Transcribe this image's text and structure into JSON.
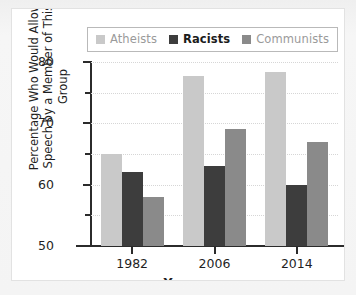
{
  "chart_data": {
    "type": "bar",
    "title": "",
    "xlabel": "Year",
    "ylabel": "Percentage Who Would Allow Speech by a Member of This Group",
    "ylabel_line1": "Percentage Who Would Allow",
    "ylabel_line2": "Speech by a Member of This Group",
    "categories": [
      "1982",
      "2006",
      "2014"
    ],
    "series": [
      {
        "name": "Atheists",
        "color": "#c9c9c9",
        "values": [
          65.0,
          77.8,
          78.4
        ]
      },
      {
        "name": "Racists",
        "color": "#3d3d3d",
        "values": [
          62.0,
          63.0,
          60.0
        ]
      },
      {
        "name": "Communists",
        "color": "#8a8a8a",
        "values": [
          58.0,
          69.0,
          67.0
        ]
      }
    ],
    "ylim": [
      50,
      80
    ],
    "ytick_major": [
      50,
      60,
      70,
      80
    ],
    "ytick_minor": [
      55,
      65,
      75
    ],
    "ytick_labels": [
      "50",
      "60",
      "70",
      "80"
    ],
    "grid": true,
    "grid_color": "#d6d6d6",
    "legend_position": "top",
    "axis_color": "#2b2b2b",
    "background": "#ffffff"
  },
  "legend": {
    "items": [
      {
        "label": "Atheists",
        "swatch": "#c9c9c9",
        "text_style": "light"
      },
      {
        "label": "Racists",
        "swatch": "#3d3d3d",
        "text_style": "dark"
      },
      {
        "label": "Communists",
        "swatch": "#8a8a8a",
        "text_style": "mid"
      }
    ]
  }
}
